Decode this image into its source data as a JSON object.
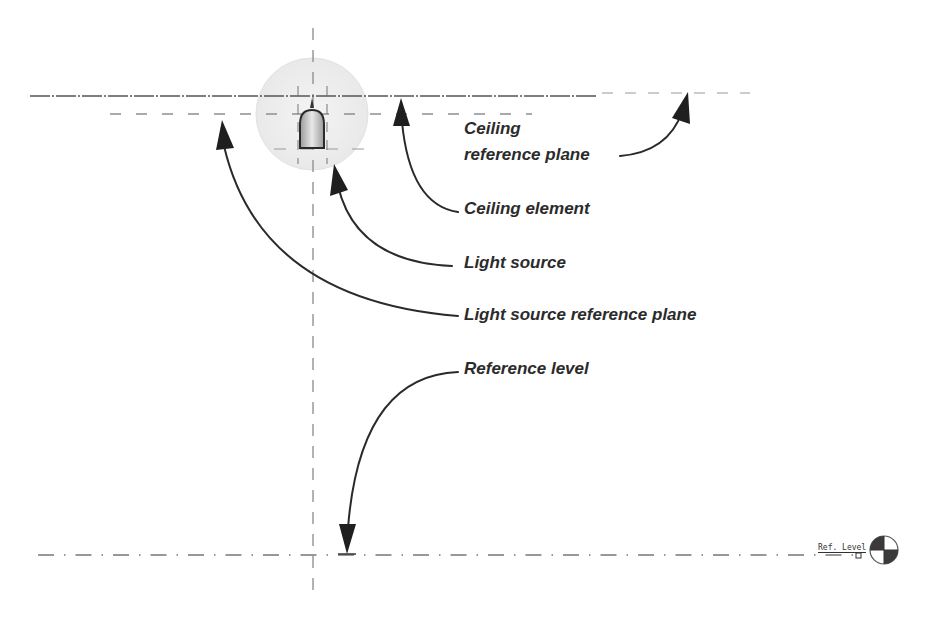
{
  "diagram": {
    "labels": {
      "ceiling_reference_plane_line1": "Ceiling",
      "ceiling_reference_plane_line2": "reference plane",
      "ceiling_element": "Ceiling element",
      "light_source": "Light source",
      "light_source_reference_plane": "Light source reference plane",
      "reference_level": "Reference level"
    },
    "level_marker": {
      "name": "Ref. Level",
      "symbol": "level-head-icon"
    },
    "colors": {
      "line": "#3a3a3a",
      "dashed_line": "#8a8a8a",
      "arrow": "#2a2a2a",
      "text": "#2b2b2b",
      "light_halo": "#ececec",
      "fixture_fill": "#d4d4d4"
    }
  }
}
